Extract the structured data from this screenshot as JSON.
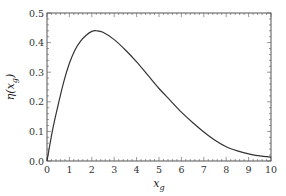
{
  "chart_data": {
    "type": "line",
    "title": "",
    "xlabel": "x_g",
    "ylabel": "η(x_g)",
    "xlim": [
      0,
      10
    ],
    "ylim": [
      0,
      0.5
    ],
    "grid": false,
    "legend": null,
    "x_ticks": [
      "0",
      "1",
      "2",
      "3",
      "4",
      "5",
      "6",
      "7",
      "8",
      "9",
      "10"
    ],
    "y_ticks": [
      "0.0",
      "0.1",
      "0.2",
      "0.3",
      "0.4",
      "0.5"
    ],
    "series": [
      {
        "name": "η(x_g)",
        "color": "#333333",
        "x": [
          0,
          0.25,
          0.5,
          0.75,
          1,
          1.25,
          1.5,
          1.75,
          2,
          2.2,
          2.5,
          3,
          3.5,
          4,
          4.5,
          5,
          5.5,
          6,
          6.5,
          7,
          7.5,
          8,
          8.5,
          9,
          9.5,
          10
        ],
        "values": [
          0,
          0.105,
          0.19,
          0.268,
          0.33,
          0.375,
          0.405,
          0.425,
          0.438,
          0.44,
          0.435,
          0.41,
          0.375,
          0.335,
          0.29,
          0.245,
          0.205,
          0.165,
          0.13,
          0.098,
          0.07,
          0.048,
          0.034,
          0.024,
          0.017,
          0.013
        ]
      }
    ]
  }
}
